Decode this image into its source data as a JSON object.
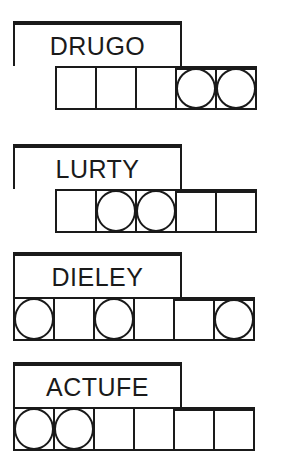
{
  "puzzles": [
    {
      "scrambled": "DRUGO",
      "letter_count": 5,
      "slots_offset": 1,
      "circled": [
        4,
        5
      ]
    },
    {
      "scrambled": "LURTY",
      "letter_count": 5,
      "slots_offset": 1,
      "circled": [
        2,
        3
      ]
    },
    {
      "scrambled": "DIELEY",
      "letter_count": 6,
      "slots_offset": 0,
      "circled": [
        1,
        3,
        6
      ]
    },
    {
      "scrambled": "ACTUFE",
      "letter_count": 6,
      "slots_offset": 0,
      "circled": [
        1,
        2
      ]
    }
  ]
}
